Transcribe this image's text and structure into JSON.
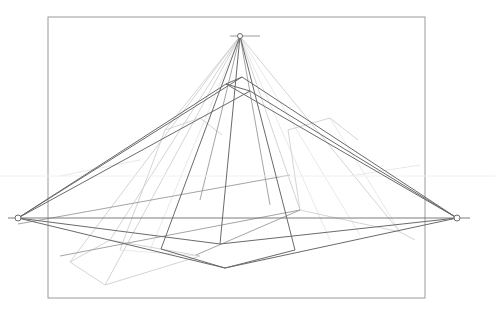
{
  "drawing": {
    "title": "Three-point perspective construction",
    "width": 495,
    "height": 320,
    "colors": {
      "background": "#ffffff",
      "frame": "#9a9a9a",
      "horizon": "#6e6e6e",
      "dark_line": "#6a6a6a",
      "mid_line": "#9a9a9a",
      "light_line": "#cfcfcf",
      "faint_line": "#e2e2e2"
    },
    "frame": {
      "x": 48,
      "y": 17,
      "w": 377,
      "h": 281
    },
    "horizon": {
      "y": 218,
      "x1": 8,
      "x2": 470
    },
    "faint_horizontal": {
      "y": 176,
      "x1": 0,
      "x2": 495
    },
    "vanishing_points": {
      "left": {
        "x": 18,
        "y": 218,
        "r": 3
      },
      "right": {
        "x": 457,
        "y": 218,
        "r": 3
      },
      "top": {
        "x": 240,
        "y": 36,
        "r": 2.5,
        "tick_x1": 230,
        "tick_x2": 260
      }
    },
    "dark_lines": [
      [
        18,
        218,
        242,
        77
      ],
      [
        18,
        218,
        226,
        84
      ],
      [
        242,
        77,
        457,
        218
      ],
      [
        226,
        84,
        457,
        218
      ],
      [
        242,
        77,
        226,
        84
      ],
      [
        226,
        84,
        250,
        91
      ],
      [
        18,
        218,
        250,
        91
      ],
      [
        250,
        91,
        457,
        218
      ],
      [
        18,
        218,
        220,
        244
      ],
      [
        220,
        244,
        457,
        218
      ],
      [
        18,
        218,
        225,
        268
      ],
      [
        225,
        268,
        457,
        218
      ],
      [
        161,
        249,
        225,
        268
      ],
      [
        295,
        250,
        225,
        268
      ],
      [
        240,
        36,
        161,
        249
      ],
      [
        240,
        36,
        295,
        250
      ],
      [
        240,
        36,
        220,
        244
      ]
    ],
    "mid_lines": [
      [
        18,
        224,
        290,
        175
      ],
      [
        60,
        256,
        300,
        210
      ],
      [
        196,
        255,
        300,
        210
      ],
      [
        240,
        36,
        200,
        200
      ],
      [
        240,
        36,
        270,
        205
      ]
    ],
    "light_lines": [
      [
        70,
        262,
        110,
        240
      ],
      [
        110,
        240,
        200,
        256
      ],
      [
        200,
        256,
        105,
        285
      ],
      [
        105,
        285,
        70,
        262
      ],
      [
        240,
        36,
        70,
        262
      ],
      [
        240,
        36,
        110,
        240
      ],
      [
        240,
        36,
        105,
        285
      ],
      [
        300,
        210,
        400,
        232
      ],
      [
        400,
        232,
        415,
        240
      ],
      [
        300,
        210,
        288,
        130
      ],
      [
        288,
        130,
        330,
        118
      ],
      [
        330,
        118,
        358,
        140
      ],
      [
        240,
        36,
        300,
        210
      ],
      [
        240,
        36,
        400,
        232
      ],
      [
        165,
        130,
        200,
        118
      ],
      [
        200,
        118,
        222,
        135
      ],
      [
        165,
        130,
        120,
        250
      ],
      [
        240,
        36,
        165,
        130
      ]
    ],
    "faint_lines": [
      [
        240,
        36,
        330,
        240
      ],
      [
        240,
        36,
        360,
        235
      ],
      [
        240,
        36,
        150,
        250
      ],
      [
        330,
        118,
        400,
        232
      ],
      [
        120,
        250,
        200,
        256
      ],
      [
        60,
        176,
        140,
        160
      ],
      [
        350,
        176,
        420,
        165
      ]
    ]
  }
}
